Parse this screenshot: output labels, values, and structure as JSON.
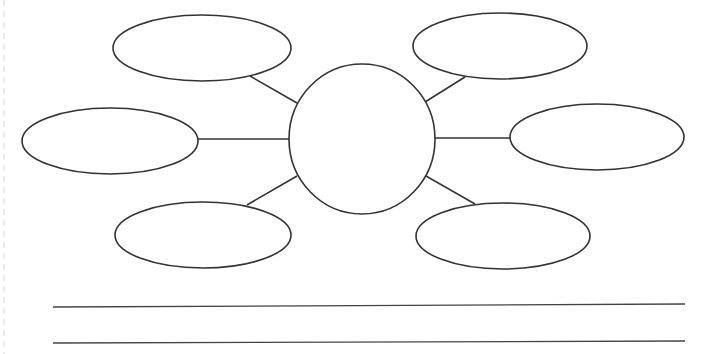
{
  "diagram": {
    "type": "bubble-map",
    "colors": {
      "stroke": "#333333",
      "fill": "#ffffff",
      "background": "#ffffff"
    },
    "center": {
      "label": "",
      "cx": 362,
      "cy": 139,
      "rx": 73,
      "ry": 75
    },
    "bubbles": [
      {
        "id": "top-left",
        "label": "",
        "cx": 202,
        "cy": 48,
        "rx": 89,
        "ry": 33
      },
      {
        "id": "top-right",
        "label": "",
        "cx": 500,
        "cy": 46,
        "rx": 87,
        "ry": 33
      },
      {
        "id": "middle-left",
        "label": "",
        "cx": 110,
        "cy": 141,
        "rx": 88,
        "ry": 33
      },
      {
        "id": "middle-right",
        "label": "",
        "cx": 597,
        "cy": 137,
        "rx": 87,
        "ry": 33
      },
      {
        "id": "bottom-left",
        "label": "",
        "cx": 203,
        "cy": 235,
        "rx": 88,
        "ry": 33
      },
      {
        "id": "bottom-right",
        "label": "",
        "cx": 503,
        "cy": 236,
        "rx": 87,
        "ry": 33
      }
    ],
    "connectors": [
      {
        "from": "top-left",
        "x1": 250,
        "y1": 76,
        "x2": 297,
        "y2": 103
      },
      {
        "from": "top-right",
        "x1": 465,
        "y1": 77,
        "x2": 425,
        "y2": 102
      },
      {
        "from": "middle-left",
        "x1": 198,
        "y1": 139,
        "x2": 289,
        "y2": 139
      },
      {
        "from": "middle-right",
        "x1": 434,
        "y1": 138,
        "x2": 511,
        "y2": 138
      },
      {
        "from": "bottom-left",
        "x1": 247,
        "y1": 205,
        "x2": 297,
        "y2": 176
      },
      {
        "from": "bottom-right",
        "x1": 426,
        "y1": 176,
        "x2": 475,
        "y2": 204
      }
    ],
    "answer_lines": [
      {
        "x1": 53,
        "y1": 307,
        "x2": 685,
        "y2": 304,
        "value": ""
      },
      {
        "x1": 53,
        "y1": 343,
        "x2": 685,
        "y2": 341,
        "value": ""
      }
    ]
  }
}
